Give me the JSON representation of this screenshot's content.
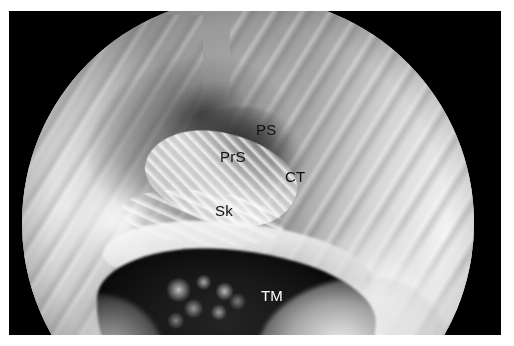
{
  "figure": {
    "kind": "endoscopic-photograph",
    "modality": "transcanal endoscopic view of the middle ear",
    "frame_color": "#000000",
    "page_background": "#ffffff",
    "field_of_view_shape": "circle"
  },
  "annotations": [
    {
      "id": "ps",
      "label": "PS",
      "full_name": "posterior sinus",
      "text_color": "#101010",
      "style": "dark",
      "x": 247,
      "y": 111
    },
    {
      "id": "prs",
      "label": "PrS",
      "full_name": "prussak space",
      "text_color": "#101010",
      "style": "dark",
      "x": 211,
      "y": 138
    },
    {
      "id": "ct",
      "label": "CT",
      "full_name": "chorda tympani",
      "text_color": "#101010",
      "style": "dark",
      "x": 276,
      "y": 158
    },
    {
      "id": "sk",
      "label": "Sk",
      "full_name": "subiculum",
      "text_color": "#101010",
      "style": "dark",
      "x": 206,
      "y": 192
    },
    {
      "id": "tm",
      "label": "TM",
      "full_name": "tympanic membrane",
      "text_color": "#ffffff",
      "style": "light",
      "x": 252,
      "y": 277
    }
  ]
}
